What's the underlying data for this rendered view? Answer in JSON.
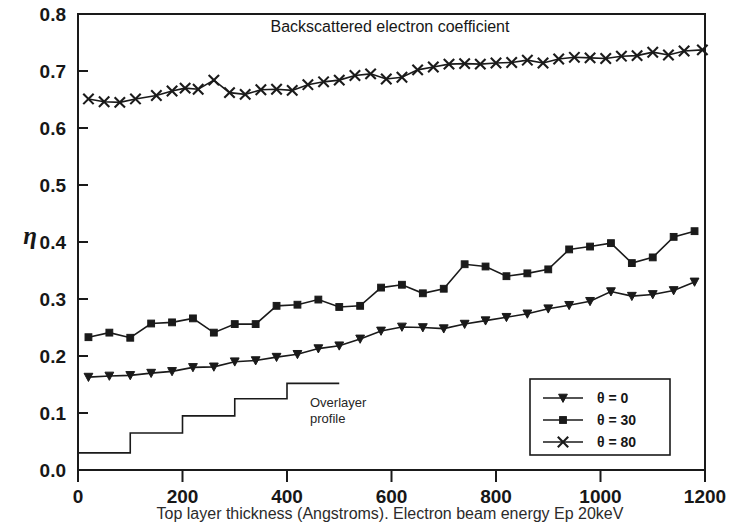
{
  "figure": {
    "title": "Backscattered electron coefficient",
    "caption": "Top layer thickness (Angstroms). Electron beam energy Ep 20keV",
    "annotation_line1": "Overlayer",
    "annotation_line2": "profile",
    "y_axis_symbol": "η"
  },
  "chart_data": {
    "type": "line",
    "title": "Backscattered electron coefficient",
    "xlabel": "Top layer thickness (Angstroms). Electron beam energy Ep 20keV",
    "ylabel": "η",
    "xlim": [
      0,
      1200
    ],
    "ylim": [
      0.0,
      0.8
    ],
    "xticks": [
      0,
      200,
      400,
      600,
      800,
      1000,
      1200
    ],
    "yticks": [
      0.0,
      0.1,
      0.2,
      0.3,
      0.4,
      0.5,
      0.6,
      0.7,
      0.8
    ],
    "xtick_labels": [
      "0",
      "200",
      "400",
      "600",
      "800",
      "1000",
      "1200"
    ],
    "ytick_labels": [
      "0.0",
      "0.1",
      "0.2",
      "0.3",
      "0.4",
      "0.5",
      "0.6",
      "0.7",
      "0.8"
    ],
    "grid": false,
    "legend_position": "lower right",
    "series": [
      {
        "name": "θ = 0",
        "marker": "triangle-down",
        "x": [
          20,
          60,
          100,
          140,
          180,
          220,
          260,
          300,
          340,
          380,
          420,
          460,
          500,
          540,
          580,
          620,
          660,
          700,
          740,
          780,
          820,
          860,
          900,
          940,
          980,
          1020,
          1060,
          1100,
          1140,
          1180
        ],
        "y": [
          0.163,
          0.165,
          0.166,
          0.17,
          0.173,
          0.18,
          0.181,
          0.19,
          0.192,
          0.198,
          0.203,
          0.213,
          0.218,
          0.23,
          0.244,
          0.251,
          0.25,
          0.248,
          0.256,
          0.262,
          0.268,
          0.274,
          0.283,
          0.289,
          0.296,
          0.313,
          0.305,
          0.308,
          0.315,
          0.33
        ]
      },
      {
        "name": "θ = 30",
        "marker": "square",
        "x": [
          20,
          60,
          100,
          140,
          180,
          220,
          260,
          300,
          340,
          380,
          420,
          460,
          500,
          540,
          580,
          620,
          660,
          700,
          740,
          780,
          820,
          860,
          900,
          940,
          980,
          1020,
          1060,
          1100,
          1140,
          1180
        ],
        "y": [
          0.233,
          0.241,
          0.232,
          0.257,
          0.259,
          0.266,
          0.241,
          0.256,
          0.256,
          0.288,
          0.29,
          0.299,
          0.286,
          0.288,
          0.32,
          0.325,
          0.31,
          0.318,
          0.361,
          0.357,
          0.34,
          0.345,
          0.352,
          0.387,
          0.392,
          0.398,
          0.363,
          0.373,
          0.409,
          0.419
        ]
      },
      {
        "name": "θ = 80",
        "marker": "x",
        "x": [
          20,
          50,
          80,
          110,
          150,
          180,
          205,
          230,
          260,
          290,
          320,
          350,
          380,
          410,
          440,
          470,
          500,
          530,
          560,
          590,
          620,
          650,
          680,
          710,
          740,
          770,
          800,
          830,
          860,
          890,
          920,
          950,
          980,
          1010,
          1040,
          1070,
          1100,
          1130,
          1160,
          1195
        ],
        "y": [
          0.651,
          0.646,
          0.645,
          0.651,
          0.657,
          0.665,
          0.67,
          0.668,
          0.684,
          0.662,
          0.659,
          0.667,
          0.668,
          0.666,
          0.676,
          0.681,
          0.684,
          0.692,
          0.695,
          0.686,
          0.689,
          0.702,
          0.707,
          0.712,
          0.713,
          0.712,
          0.714,
          0.715,
          0.719,
          0.714,
          0.721,
          0.724,
          0.723,
          0.722,
          0.726,
          0.727,
          0.733,
          0.728,
          0.735,
          0.737
        ]
      }
    ],
    "step_profile": {
      "name": "Overlayer profile",
      "x": [
        0,
        100,
        100,
        200,
        200,
        300,
        300,
        400,
        400,
        500
      ],
      "y": [
        0.03,
        0.03,
        0.065,
        0.065,
        0.095,
        0.095,
        0.125,
        0.125,
        0.152,
        0.152
      ]
    }
  },
  "legend": {
    "items": [
      {
        "label": "θ = 0",
        "marker": "triangle-down"
      },
      {
        "label": "θ = 30",
        "marker": "square"
      },
      {
        "label": "θ = 80",
        "marker": "x"
      }
    ]
  },
  "colors": {
    "ink": "#1a1a1a",
    "background": "#ffffff"
  }
}
